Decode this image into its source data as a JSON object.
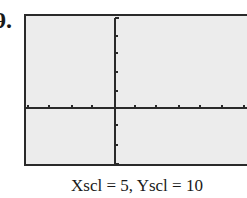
{
  "problem": {
    "number": "9."
  },
  "graph": {
    "window": {
      "xscl": 5,
      "yscl": 10,
      "x_tick_count_left": 3,
      "x_tick_count_right": 6,
      "y_tick_count_above": 4,
      "y_tick_count_below": 2
    },
    "caption": "Xscl = 5, Yscl = 10",
    "colors": {
      "screen": "#ececec",
      "axis": "#2a2a2a",
      "frame": "#2a2a2a"
    }
  }
}
